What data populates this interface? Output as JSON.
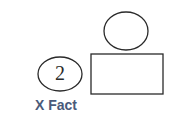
{
  "diagram": {
    "shapes": [
      {
        "type": "ellipse",
        "name": "top-circle",
        "cx": 126,
        "cy": 31,
        "rx": 22,
        "ry": 19,
        "label": ""
      },
      {
        "type": "rectangle",
        "name": "box",
        "x": 91,
        "y": 54,
        "width": 72,
        "height": 40,
        "label": ""
      },
      {
        "type": "ellipse",
        "name": "numbered-circle",
        "cx": 60,
        "cy": 74,
        "rx": 22,
        "ry": 17,
        "label": "2"
      }
    ],
    "number_label": "2",
    "caption": "X Fact",
    "colors": {
      "stroke": "#2a2a2a",
      "caption": "#4a5a7a",
      "background": "#ffffff"
    }
  }
}
